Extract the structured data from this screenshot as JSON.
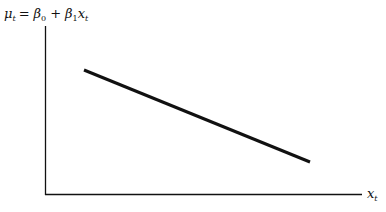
{
  "diagram": {
    "equation": {
      "mu": "μ",
      "mu_sub": "t",
      "equals": "=",
      "beta": "β",
      "beta0_sub": "0",
      "plus": "+",
      "beta1_sub": "1",
      "x": "x",
      "x_sub": "t"
    },
    "x_axis_label": "x",
    "x_axis_sub": "t",
    "line": {
      "description": "decreasing linear relationship (β1 < 0)"
    }
  }
}
